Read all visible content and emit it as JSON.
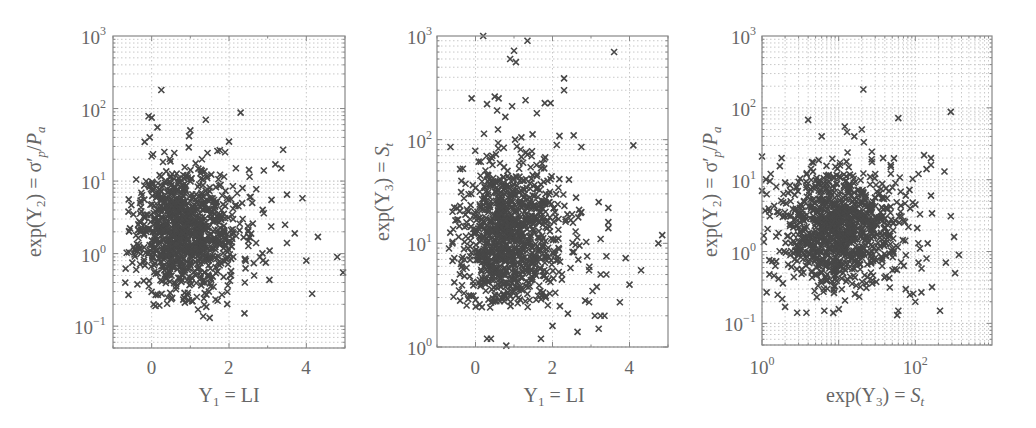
{
  "figure": {
    "background": "#ffffff",
    "marker_color": "#474747",
    "grid_color": "#c8c8c8",
    "axis_color": "#888888",
    "text_color": "#666666"
  },
  "chart_data": [
    {
      "type": "scatter",
      "marker": "x",
      "title": "",
      "xlabel": "Y1 = LI",
      "ylabel": "exp(Y2) = σ'p/Pa",
      "xscale": "linear",
      "yscale": "log",
      "xlim": [
        -1,
        5
      ],
      "ylim": [
        0.05,
        1000
      ],
      "xticks": [
        0,
        2,
        4
      ],
      "xtick_labels": [
        "0",
        "2",
        "4"
      ],
      "yticks": [
        0.1,
        1,
        10,
        100,
        1000
      ],
      "ytick_labels": [
        "10^-1",
        "10^0",
        "10^1",
        "10^2",
        "10^3"
      ],
      "grid": true,
      "legend": null,
      "cluster": {
        "n": 1050,
        "seed": 11,
        "x_mean": 0.8,
        "x_sd": 0.55,
        "logy_mean": 0.32,
        "logy_sd": 0.42,
        "x_skew": 0.35
      },
      "points": [
        [
          0.25,
          180
        ],
        [
          2.3,
          88
        ],
        [
          1.4,
          70
        ],
        [
          0.0,
          75
        ],
        [
          0.15,
          55
        ],
        [
          -0.05,
          40
        ],
        [
          0.0,
          22
        ],
        [
          -0.4,
          10.5
        ],
        [
          -0.6,
          3.8
        ],
        [
          -0.5,
          0.75
        ],
        [
          -0.4,
          0.6
        ],
        [
          -0.6,
          0.27
        ],
        [
          -0.3,
          5
        ],
        [
          -0.2,
          1.8
        ],
        [
          -0.35,
          2.1
        ],
        [
          3.4,
          27
        ],
        [
          3.2,
          17
        ],
        [
          3.35,
          15
        ],
        [
          2.9,
          14
        ],
        [
          3.5,
          6.5
        ],
        [
          3.9,
          5.8
        ],
        [
          3.1,
          5.5
        ],
        [
          3.45,
          2.5
        ],
        [
          3.7,
          1.9
        ],
        [
          4.3,
          1.7
        ],
        [
          3.5,
          1.4
        ],
        [
          4.0,
          0.8
        ],
        [
          4.8,
          0.9
        ],
        [
          4.95,
          0.55
        ],
        [
          4.15,
          0.28
        ],
        [
          2.4,
          0.15
        ],
        [
          1.5,
          0.13
        ],
        [
          1.2,
          0.17
        ],
        [
          2.5,
          2.1
        ],
        [
          2.6,
          5
        ],
        [
          2.7,
          1.4
        ],
        [
          2.9,
          3.6
        ],
        [
          3.05,
          1.1
        ],
        [
          2.65,
          0.5
        ],
        [
          2.8,
          0.9
        ],
        [
          2.95,
          0.75
        ],
        [
          2.0,
          35
        ],
        [
          2.1,
          8.5
        ],
        [
          1.7,
          26
        ],
        [
          1.0,
          50
        ],
        [
          1.3,
          20
        ],
        [
          2.35,
          8
        ],
        [
          2.5,
          1.5
        ],
        [
          1.9,
          25
        ],
        [
          0.05,
          0.2
        ],
        [
          0.1,
          0.19
        ]
      ]
    },
    {
      "type": "scatter",
      "marker": "x",
      "title": "",
      "xlabel": "Y1 = LI",
      "ylabel": "exp(Y3) = St",
      "xscale": "linear",
      "yscale": "log",
      "xlim": [
        -1,
        5
      ],
      "ylim": [
        1,
        1000
      ],
      "xticks": [
        0,
        2,
        4
      ],
      "xtick_labels": [
        "0",
        "2",
        "4"
      ],
      "yticks": [
        1,
        10,
        100,
        1000
      ],
      "ytick_labels": [
        "10^0",
        "10^1",
        "10^2",
        "10^3"
      ],
      "grid": true,
      "legend": null,
      "cluster": {
        "n": 1050,
        "seed": 23,
        "x_mean": 0.8,
        "x_sd": 0.55,
        "logy_mean": 1.05,
        "logy_sd": 0.38,
        "x_skew": 0.35
      },
      "points": [
        [
          0.2,
          1000
        ],
        [
          1.35,
          900
        ],
        [
          1.0,
          720
        ],
        [
          3.6,
          700
        ],
        [
          0.9,
          600
        ],
        [
          1.05,
          560
        ],
        [
          2.3,
          390
        ],
        [
          2.3,
          300
        ],
        [
          -0.1,
          250
        ],
        [
          0.3,
          220
        ],
        [
          0.5,
          260
        ],
        [
          0.6,
          250
        ],
        [
          1.3,
          240
        ],
        [
          1.8,
          225
        ],
        [
          1.95,
          225
        ],
        [
          0.95,
          210
        ],
        [
          2.55,
          110
        ],
        [
          2.75,
          85
        ],
        [
          4.1,
          88
        ],
        [
          -0.65,
          85
        ],
        [
          -0.4,
          52
        ],
        [
          -0.4,
          23
        ],
        [
          -0.45,
          17
        ],
        [
          -0.6,
          10
        ],
        [
          -0.55,
          7.2
        ],
        [
          -0.55,
          4.2
        ],
        [
          -0.4,
          2.8
        ],
        [
          -0.3,
          3.3
        ],
        [
          4.85,
          12
        ],
        [
          4.75,
          10
        ],
        [
          4.3,
          5.5
        ],
        [
          3.9,
          7.2
        ],
        [
          4.0,
          4.0
        ],
        [
          3.75,
          2.7
        ],
        [
          3.45,
          22
        ],
        [
          3.2,
          25
        ],
        [
          3.25,
          11
        ],
        [
          3.45,
          16
        ],
        [
          3.45,
          14
        ],
        [
          3.4,
          7.5
        ],
        [
          3.4,
          5
        ],
        [
          3.25,
          5
        ],
        [
          3.15,
          3.8
        ],
        [
          3.1,
          2.0
        ],
        [
          3.25,
          2.0
        ],
        [
          3.35,
          2.0
        ],
        [
          3.2,
          1.5
        ],
        [
          2.65,
          1.4
        ],
        [
          2.4,
          2.1
        ],
        [
          2.0,
          1.6
        ],
        [
          1.7,
          1.2
        ],
        [
          0.8,
          1.03
        ],
        [
          0.3,
          1.2
        ],
        [
          0.4,
          1.2
        ],
        [
          2.95,
          5.5
        ],
        [
          2.85,
          2.8
        ],
        [
          2.95,
          2.7
        ],
        [
          2.7,
          9.5
        ],
        [
          2.9,
          7.5
        ],
        [
          2.6,
          13
        ],
        [
          2.75,
          20
        ]
      ]
    },
    {
      "type": "scatter",
      "marker": "x",
      "title": "",
      "xlabel": "exp(Y3) = St",
      "ylabel": "exp(Y2) = σ'p/Pa",
      "xscale": "log",
      "yscale": "log",
      "xlim": [
        1,
        1000
      ],
      "ylim": [
        0.05,
        1000
      ],
      "xticks": [
        1,
        100
      ],
      "xtick_labels": [
        "10^0",
        "10^2"
      ],
      "yticks": [
        0.1,
        1,
        10,
        100,
        1000
      ],
      "ytick_labels": [
        "10^-1",
        "10^0",
        "10^1",
        "10^2",
        "10^3"
      ],
      "grid": true,
      "legend": null,
      "cluster": {
        "n": 1050,
        "seed": 37,
        "logx_mean": 1.0,
        "logx_sd": 0.38,
        "logy_mean": 0.32,
        "logy_sd": 0.4
      },
      "points": [
        [
          21,
          180
        ],
        [
          4,
          68
        ],
        [
          60,
          72
        ],
        [
          290,
          88
        ],
        [
          1.0,
          21
        ],
        [
          1.0,
          7
        ],
        [
          1.1,
          3.7
        ],
        [
          1.3,
          12
        ],
        [
          1.8,
          20
        ],
        [
          130,
          22
        ],
        [
          160,
          20
        ],
        [
          160,
          16
        ],
        [
          140,
          14
        ],
        [
          160,
          6
        ],
        [
          165,
          3.4
        ],
        [
          240,
          13
        ],
        [
          290,
          3.1
        ],
        [
          320,
          1.6
        ],
        [
          250,
          0.7
        ],
        [
          330,
          0.5
        ],
        [
          370,
          0.9
        ],
        [
          165,
          0.32
        ],
        [
          210,
          0.15
        ],
        [
          140,
          0.8
        ],
        [
          145,
          1.3
        ],
        [
          115,
          1.1
        ],
        [
          110,
          0.7
        ],
        [
          120,
          0.27
        ],
        [
          100,
          0.2
        ],
        [
          85,
          0.25
        ],
        [
          75,
          0.3
        ],
        [
          60,
          0.15
        ],
        [
          58,
          0.13
        ],
        [
          1.6,
          0.25
        ],
        [
          1.25,
          0.48
        ],
        [
          1.15,
          0.27
        ],
        [
          2.0,
          0.17
        ],
        [
          6.5,
          0.15
        ],
        [
          8.5,
          0.14
        ],
        [
          110,
          12
        ],
        [
          100,
          4.5
        ],
        [
          75,
          6
        ],
        [
          115,
          3.3
        ],
        [
          48,
          15
        ],
        [
          38,
          20
        ],
        [
          30,
          12
        ],
        [
          20,
          50
        ],
        [
          12,
          55
        ],
        [
          6,
          40
        ],
        [
          16,
          40
        ]
      ]
    }
  ]
}
